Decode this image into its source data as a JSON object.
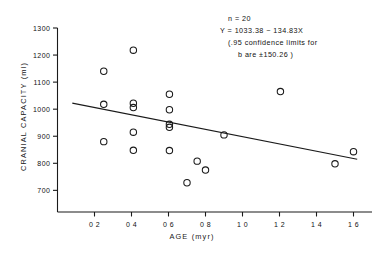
{
  "figure": {
    "background": "#ffffff",
    "ink": "#1a1a1a"
  },
  "annotations": {
    "n": "n = 20",
    "equation": "Y = 1033.38 − 134.83X",
    "ci_line1": "(.95 confidence limits for",
    "ci_line2": "b are ±150.26 )"
  },
  "chart_data": {
    "type": "scatter",
    "title": "",
    "xlabel": "AGE (myr)",
    "ylabel": "CRANIAL CAPACITY (ml)",
    "xlim": [
      0.0,
      1.7
    ],
    "ylim": [
      620,
      1300
    ],
    "grid": false,
    "legend": "none",
    "xticks": [
      0.2,
      0.4,
      0.6,
      0.8,
      1.0,
      1.2,
      1.4,
      1.6
    ],
    "xticklabels": [
      "0 2",
      "0 4",
      "0 6",
      "0 8",
      "1 0",
      "1 2",
      "1 4",
      "1 6"
    ],
    "yticks": [
      700,
      800,
      900,
      1000,
      1100,
      1200,
      1300
    ],
    "yticklabels": [
      "700",
      "800",
      "900",
      "1000",
      "1100",
      "1200",
      "1300"
    ],
    "n": 20,
    "marker": "open-circle",
    "points": [
      {
        "x": 0.25,
        "y": 1140
      },
      {
        "x": 0.25,
        "y": 1018
      },
      {
        "x": 0.25,
        "y": 880
      },
      {
        "x": 0.41,
        "y": 1218
      },
      {
        "x": 0.41,
        "y": 1022
      },
      {
        "x": 0.41,
        "y": 1006
      },
      {
        "x": 0.41,
        "y": 915
      },
      {
        "x": 0.41,
        "y": 848
      },
      {
        "x": 0.605,
        "y": 1055
      },
      {
        "x": 0.605,
        "y": 998
      },
      {
        "x": 0.605,
        "y": 944
      },
      {
        "x": 0.605,
        "y": 933
      },
      {
        "x": 0.605,
        "y": 847
      },
      {
        "x": 0.7,
        "y": 728
      },
      {
        "x": 0.755,
        "y": 808
      },
      {
        "x": 0.8,
        "y": 775
      },
      {
        "x": 0.9,
        "y": 905
      },
      {
        "x": 1.205,
        "y": 1065
      },
      {
        "x": 1.5,
        "y": 798
      },
      {
        "x": 1.6,
        "y": 843
      }
    ],
    "fit_line": {
      "kind": "linear-regression",
      "intercept": 1033.38,
      "slope": -134.83,
      "x_start": 0.08,
      "x_end": 1.62,
      "y_start": 1022.6,
      "y_end": 814.9
    }
  }
}
